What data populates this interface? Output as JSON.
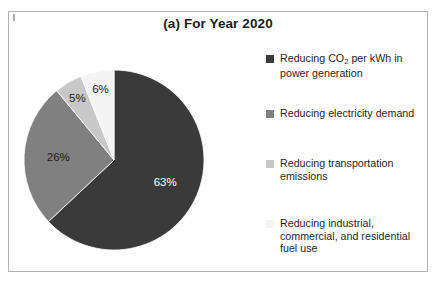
{
  "figure": {
    "title": "(a) For Year 2020",
    "frame_color": "#b3b3b3",
    "background": "#ffffff"
  },
  "legend": {
    "position": "right",
    "entries": [
      {
        "label_prefix": "Reducing CO",
        "label_sub": "2",
        "label_suffix": " per kWh in power generation",
        "full_label": "Reducing CO2 per kWh in power generation",
        "color": "#3a3a3a"
      },
      {
        "label_prefix": "Reducing electricity demand",
        "label_sub": "",
        "label_suffix": "",
        "full_label": "Reducing electricity demand",
        "color": "#808080"
      },
      {
        "label_prefix": "Reducing transportation emissions",
        "label_sub": "",
        "label_suffix": "",
        "full_label": "Reducing transportation emissions",
        "color": "#c8c8c8"
      },
      {
        "label_prefix": "Reducing industrial, commercial, and residential fuel use",
        "label_sub": "",
        "label_suffix": "",
        "full_label": "Reducing industrial, commercial, and residential fuel use",
        "color": "#f4f4f4"
      }
    ]
  },
  "chart_data": {
    "type": "pie",
    "title": "(a) For Year 2020",
    "xlabel": "",
    "ylabel": "",
    "start_angle_deg": 0,
    "direction": "clockwise",
    "categories": [
      "Reducing CO2 per kWh in power generation",
      "Reducing electricity demand",
      "Reducing transportation emissions",
      "Reducing industrial, commercial, and residential fuel use"
    ],
    "values": [
      63,
      26,
      5,
      6
    ],
    "value_labels": [
      "63%",
      "26%",
      "5%",
      "6%"
    ],
    "colors": [
      "#3a3a3a",
      "#808080",
      "#c8c8c8",
      "#f4f4f4"
    ],
    "label_text_colors": [
      "#ffffff",
      "#1b1b1b",
      "#1b1b1b",
      "#1b1b1b"
    ],
    "units": "percent",
    "legend_position": "right",
    "grid": false
  }
}
